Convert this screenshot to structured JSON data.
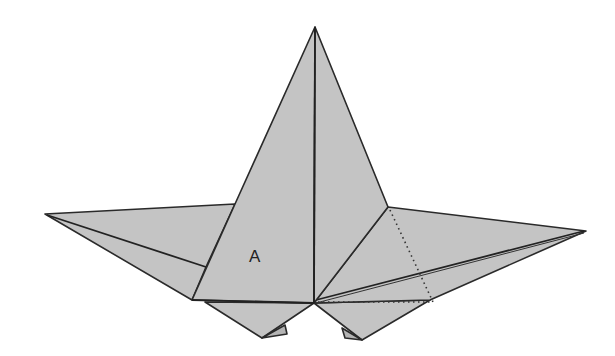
{
  "diagram": {
    "type": "origami-fold-diagram",
    "labels": [
      {
        "id": "flap-a",
        "text": "A"
      }
    ],
    "colors": {
      "paper": "#c4c4c4",
      "line": "#2a2a2a",
      "background": "#ffffff"
    },
    "line_types": [
      "solid-edge",
      "dotted-fold-line"
    ]
  }
}
